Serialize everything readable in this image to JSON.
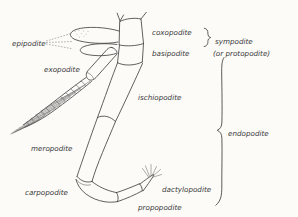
{
  "colors": {
    "background": "#fcfbf8",
    "line": "#454545",
    "text": "#3a3a3a"
  },
  "labels": {
    "epipodite": "epipodite",
    "exopodite": "exopodite",
    "coxopodite": "coxopodite",
    "basipodite": "basipodite",
    "sympodite": "sympodite",
    "sympodite_alt": "(or  protopodite)",
    "ischiopodite": "ischiopodite",
    "endopodite": "endopodite",
    "meropodite": "meropodite",
    "carpopodite": "carpopodite",
    "dactylopodite": "dactylopodite",
    "propodite": "propopodite"
  }
}
